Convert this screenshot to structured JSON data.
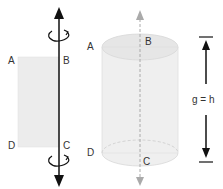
{
  "figure": {
    "rectangle": {
      "labels": {
        "A": "A",
        "B": "B",
        "C": "C",
        "D": "D"
      },
      "fill": "#ececec",
      "axis_color": "#111111"
    },
    "cylinder": {
      "labels": {
        "A": "A",
        "B": "B",
        "C": "C",
        "D": "D"
      },
      "fill": "#ececec",
      "axis_color": "#aaaaaa"
    },
    "height_label": "g = h"
  }
}
